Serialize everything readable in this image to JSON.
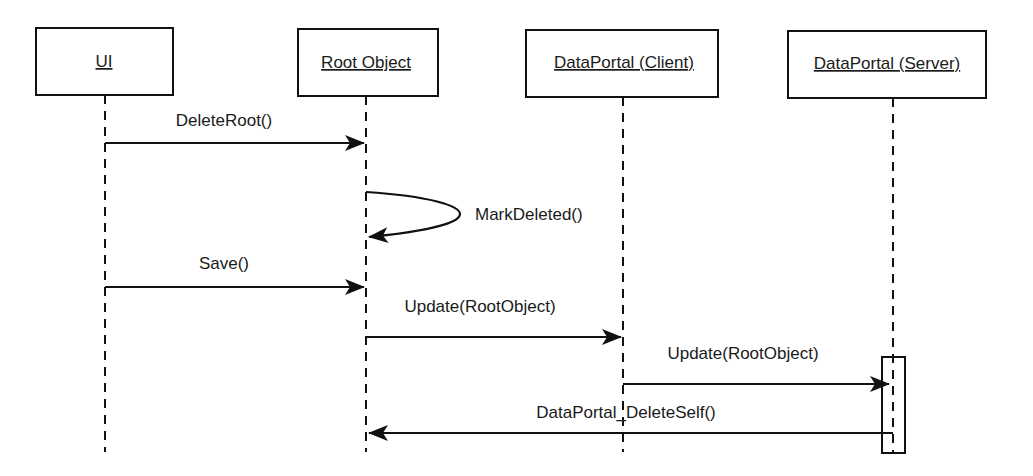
{
  "diagram": {
    "type": "sequence",
    "participants": [
      {
        "id": "ui",
        "label": "UI"
      },
      {
        "id": "root",
        "label": "Root Object"
      },
      {
        "id": "dpc",
        "label": "DataPortal (Client)"
      },
      {
        "id": "dps",
        "label": "DataPortal (Server)"
      }
    ],
    "messages": [
      {
        "from": "ui",
        "to": "root",
        "label": "DeleteRoot()",
        "kind": "call"
      },
      {
        "from": "root",
        "to": "root",
        "label": "MarkDeleted()",
        "kind": "self"
      },
      {
        "from": "ui",
        "to": "root",
        "label": "Save()",
        "kind": "call"
      },
      {
        "from": "root",
        "to": "dpc",
        "label": "Update(RootObject)",
        "kind": "call"
      },
      {
        "from": "dpc",
        "to": "dps",
        "label": "Update(RootObject)",
        "kind": "call"
      },
      {
        "from": "dps",
        "to": "root",
        "label": "DataPortal_DeleteSelf()",
        "kind": "call"
      }
    ],
    "activations": [
      {
        "participant": "dps",
        "from_message": 4,
        "to_message": 5
      }
    ]
  }
}
